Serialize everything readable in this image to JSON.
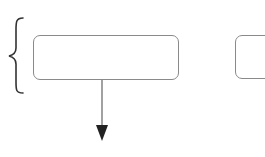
{
  "diagram": {
    "nodes": [
      {
        "id": "node-1",
        "label": "",
        "shape": "rounded-rectangle"
      },
      {
        "id": "node-2",
        "label": "",
        "shape": "rounded-rectangle",
        "clipped": true
      }
    ],
    "edges": [
      {
        "from": "node-1",
        "to": "below",
        "direction": "down",
        "style": "arrow"
      }
    ],
    "annotations": [
      {
        "type": "left-curly-brace",
        "spans": "node-1"
      }
    ],
    "colors": {
      "stroke": "#8a8a8a",
      "brace": "#333333",
      "arrow": "#333333",
      "background": "#ffffff"
    }
  }
}
